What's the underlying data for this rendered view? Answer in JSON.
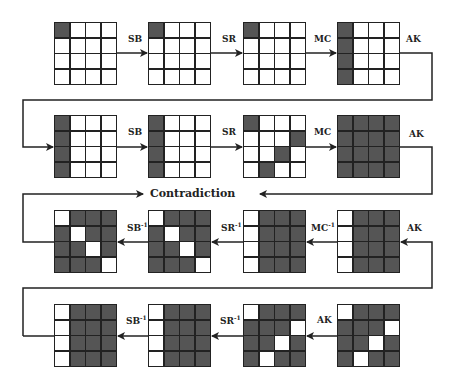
{
  "title": "Contradiction",
  "colors": {
    "active": "#555555",
    "inactive": "#ffffff",
    "line": "#222222"
  },
  "grids": [
    {
      "id": 1,
      "x": 54,
      "y": 22,
      "dark": [
        0
      ]
    },
    {
      "id": 2,
      "x": 148,
      "y": 22,
      "dark": [
        0
      ]
    },
    {
      "id": 3,
      "x": 243,
      "y": 22,
      "dark": [
        0
      ]
    },
    {
      "id": 4,
      "x": 337,
      "y": 22,
      "dark": [
        0,
        4,
        8,
        12
      ]
    },
    {
      "id": 5,
      "x": 54,
      "y": 115,
      "dark": [
        0,
        4,
        8,
        12
      ]
    },
    {
      "id": 6,
      "x": 148,
      "y": 115,
      "dark": [
        0,
        4,
        8,
        12
      ]
    },
    {
      "id": 7,
      "x": 243,
      "y": 115,
      "dark": [
        0,
        7,
        10,
        13
      ]
    },
    {
      "id": 8,
      "x": 337,
      "y": 115,
      "dark": [
        0,
        1,
        2,
        3,
        4,
        5,
        6,
        7,
        8,
        9,
        10,
        11,
        12,
        13,
        14,
        15
      ]
    },
    {
      "id": 9,
      "x": 54,
      "y": 210,
      "dark": [
        1,
        2,
        3,
        4,
        6,
        7,
        8,
        9,
        11,
        12,
        13,
        14
      ]
    },
    {
      "id": 10,
      "x": 148,
      "y": 210,
      "dark": [
        1,
        2,
        3,
        4,
        6,
        7,
        8,
        9,
        11,
        12,
        13,
        14
      ]
    },
    {
      "id": 11,
      "x": 243,
      "y": 210,
      "dark": [
        1,
        2,
        3,
        5,
        6,
        7,
        9,
        10,
        11,
        13,
        14,
        15
      ]
    },
    {
      "id": 12,
      "x": 337,
      "y": 210,
      "dark": [
        1,
        2,
        3,
        5,
        6,
        7,
        9,
        10,
        11,
        13,
        14,
        15
      ]
    },
    {
      "id": 13,
      "x": 54,
      "y": 304,
      "dark": [
        1,
        2,
        3,
        5,
        6,
        7,
        9,
        10,
        11,
        13,
        14,
        15
      ]
    },
    {
      "id": 14,
      "x": 148,
      "y": 304,
      "dark": [
        1,
        2,
        3,
        5,
        6,
        7,
        9,
        10,
        11,
        13,
        14,
        15
      ]
    },
    {
      "id": 15,
      "x": 243,
      "y": 304,
      "dark": [
        1,
        2,
        3,
        4,
        5,
        6,
        8,
        9,
        11,
        12,
        14,
        15
      ]
    },
    {
      "id": 16,
      "x": 337,
      "y": 304,
      "dark": [
        1,
        2,
        3,
        4,
        5,
        6,
        8,
        9,
        11,
        12,
        14,
        15
      ]
    }
  ],
  "labels": [
    {
      "text": "SB",
      "sup": "",
      "x": 128,
      "y": 44
    },
    {
      "text": "SR",
      "sup": "",
      "x": 222,
      "y": 44
    },
    {
      "text": "MC",
      "sup": "",
      "x": 314,
      "y": 44
    },
    {
      "text": "AK",
      "sup": "",
      "x": 406,
      "y": 44
    },
    {
      "text": "SB",
      "sup": "",
      "x": 128,
      "y": 137
    },
    {
      "text": "SR",
      "sup": "",
      "x": 222,
      "y": 137
    },
    {
      "text": "MC",
      "sup": "",
      "x": 314,
      "y": 137
    },
    {
      "text": "AK",
      "sup": "",
      "x": 409,
      "y": 139
    },
    {
      "text": "SB",
      "sup": "-1",
      "x": 127,
      "y": 231
    },
    {
      "text": "SR",
      "sup": "-1",
      "x": 221,
      "y": 231
    },
    {
      "text": "MC",
      "sup": "-1",
      "x": 311,
      "y": 231
    },
    {
      "text": "AK",
      "sup": "",
      "x": 407,
      "y": 233
    },
    {
      "text": "SB",
      "sup": "-1",
      "x": 126,
      "y": 324
    },
    {
      "text": "SR",
      "sup": "-1",
      "x": 220,
      "y": 324
    },
    {
      "text": "AK",
      "sup": "",
      "x": 317,
      "y": 325
    }
  ]
}
